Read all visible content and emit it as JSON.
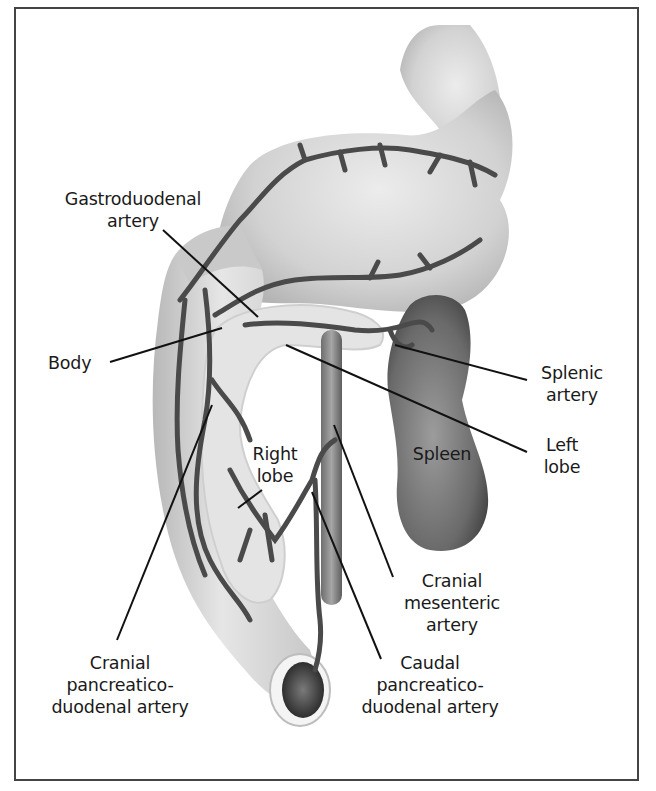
{
  "figure": {
    "type": "anatomical-illustration",
    "colors": {
      "organ_fill": "#d4d4d4",
      "organ_shade": "#9a9a9a",
      "vessel": "#4a4a4a",
      "spleen": "#6a6a6a",
      "pancreas": "#e2e2e2",
      "leader_line": "#111111",
      "border": "#444444"
    }
  },
  "labels": {
    "gastroduodenal_artery": "Gastroduodenal\nartery",
    "body": "Body",
    "splenic_artery": "Splenic\nartery",
    "left_lobe": "Left\nlobe",
    "spleen": "Spleen",
    "right_lobe": "Right\nlobe",
    "cranial_mesenteric_artery": "Cranial\nmesenteric\nartery",
    "cranial_pancreaticoduodenal_artery": "Cranial\npancreatico-\nduodenal artery",
    "caudal_pancreaticoduodenal_artery": "Caudal\npancreatico-\nduodenal artery"
  }
}
